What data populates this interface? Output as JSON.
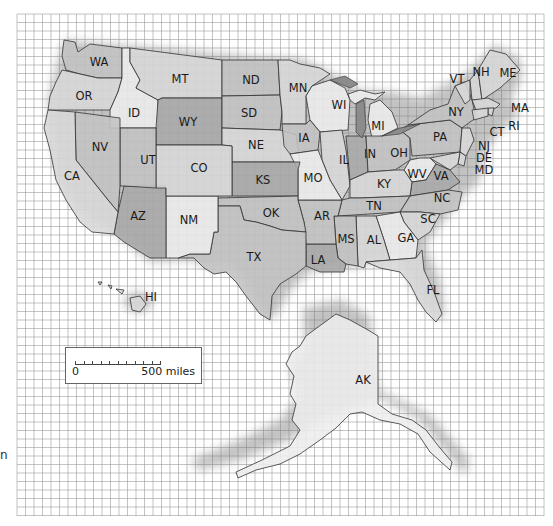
{
  "map": {
    "title": "United States state outline map",
    "grid": {
      "x0": 17,
      "y0": 14,
      "x1": 544,
      "y1": 516,
      "cell": 8.5,
      "line_color": "#9a9a9a",
      "background": "#ffffff"
    },
    "fills": {
      "very_light": "#ededed",
      "light": "#d8d8d8",
      "medium": "#c3c3c3",
      "dark": "#a9a9a9",
      "water": "#8c8c8c",
      "border": "#333333"
    },
    "states": [
      {
        "abbr": "WA",
        "x": 99,
        "y": 62,
        "tone": "medium"
      },
      {
        "abbr": "OR",
        "x": 84,
        "y": 96,
        "tone": "light"
      },
      {
        "abbr": "ID",
        "x": 134,
        "y": 113,
        "tone": "very_light"
      },
      {
        "abbr": "MT",
        "x": 180,
        "y": 79,
        "tone": "light"
      },
      {
        "abbr": "WY",
        "x": 188,
        "y": 122,
        "tone": "dark"
      },
      {
        "abbr": "ND",
        "x": 251,
        "y": 80,
        "tone": "medium"
      },
      {
        "abbr": "SD",
        "x": 249,
        "y": 113,
        "tone": "medium"
      },
      {
        "abbr": "NE",
        "x": 256,
        "y": 145,
        "tone": "light"
      },
      {
        "abbr": "MN",
        "x": 298,
        "y": 88,
        "tone": "light"
      },
      {
        "abbr": "WI",
        "x": 339,
        "y": 105,
        "tone": "very_light"
      },
      {
        "abbr": "MI",
        "x": 378,
        "y": 126,
        "tone": "very_light"
      },
      {
        "abbr": "IA",
        "x": 304,
        "y": 138,
        "tone": "medium"
      },
      {
        "abbr": "IL",
        "x": 344,
        "y": 160,
        "tone": "light"
      },
      {
        "abbr": "IN",
        "x": 370,
        "y": 154,
        "tone": "dark"
      },
      {
        "abbr": "OH",
        "x": 399,
        "y": 153,
        "tone": "medium"
      },
      {
        "abbr": "PA",
        "x": 440,
        "y": 137,
        "tone": "medium"
      },
      {
        "abbr": "NY",
        "x": 456,
        "y": 112,
        "tone": "medium"
      },
      {
        "abbr": "VT",
        "x": 457,
        "y": 79,
        "tone": "light"
      },
      {
        "abbr": "NH",
        "x": 481,
        "y": 72,
        "tone": "light"
      },
      {
        "abbr": "ME",
        "x": 508,
        "y": 73,
        "tone": "light"
      },
      {
        "abbr": "MA",
        "x": 520,
        "y": 108,
        "tone": "light"
      },
      {
        "abbr": "RI",
        "x": 514,
        "y": 126,
        "tone": "light"
      },
      {
        "abbr": "CT",
        "x": 497,
        "y": 132,
        "tone": "light"
      },
      {
        "abbr": "NJ",
        "x": 484,
        "y": 146,
        "tone": "light"
      },
      {
        "abbr": "DE",
        "x": 484,
        "y": 158,
        "tone": "light"
      },
      {
        "abbr": "MD",
        "x": 484,
        "y": 170,
        "tone": "light"
      },
      {
        "abbr": "WV",
        "x": 417,
        "y": 174,
        "tone": "very_light"
      },
      {
        "abbr": "VA",
        "x": 441,
        "y": 176,
        "tone": "dark"
      },
      {
        "abbr": "KY",
        "x": 384,
        "y": 184,
        "tone": "light"
      },
      {
        "abbr": "TN",
        "x": 374,
        "y": 206,
        "tone": "medium"
      },
      {
        "abbr": "NC",
        "x": 442,
        "y": 198,
        "tone": "medium"
      },
      {
        "abbr": "SC",
        "x": 428,
        "y": 219,
        "tone": "light"
      },
      {
        "abbr": "GA",
        "x": 406,
        "y": 238,
        "tone": "very_light"
      },
      {
        "abbr": "AL",
        "x": 374,
        "y": 240,
        "tone": "light"
      },
      {
        "abbr": "MS",
        "x": 346,
        "y": 239,
        "tone": "medium"
      },
      {
        "abbr": "LA",
        "x": 318,
        "y": 260,
        "tone": "dark"
      },
      {
        "abbr": "AR",
        "x": 322,
        "y": 216,
        "tone": "medium"
      },
      {
        "abbr": "MO",
        "x": 313,
        "y": 178,
        "tone": "very_light"
      },
      {
        "abbr": "KS",
        "x": 263,
        "y": 180,
        "tone": "dark"
      },
      {
        "abbr": "OK",
        "x": 271,
        "y": 213,
        "tone": "medium"
      },
      {
        "abbr": "TX",
        "x": 254,
        "y": 257,
        "tone": "medium"
      },
      {
        "abbr": "NM",
        "x": 189,
        "y": 220,
        "tone": "very_light"
      },
      {
        "abbr": "AZ",
        "x": 138,
        "y": 216,
        "tone": "dark"
      },
      {
        "abbr": "CO",
        "x": 199,
        "y": 168,
        "tone": "light"
      },
      {
        "abbr": "UT",
        "x": 148,
        "y": 160,
        "tone": "medium"
      },
      {
        "abbr": "NV",
        "x": 100,
        "y": 147,
        "tone": "medium"
      },
      {
        "abbr": "CA",
        "x": 72,
        "y": 176,
        "tone": "light"
      },
      {
        "abbr": "FL",
        "x": 433,
        "y": 290,
        "tone": "light"
      },
      {
        "abbr": "HI",
        "x": 151,
        "y": 297,
        "tone": "light"
      },
      {
        "abbr": "AK",
        "x": 363,
        "y": 380,
        "tone": "very_light"
      }
    ]
  },
  "scale": {
    "zero_label": "0",
    "distance_label": "500 miles",
    "ticks": 10
  },
  "edge_text": "n"
}
